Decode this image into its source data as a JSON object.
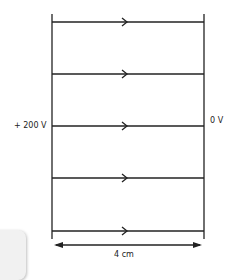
{
  "diagram": {
    "left_plate_label": "+ 200 V",
    "right_plate_label": "0 V",
    "separation_label": "4 cm",
    "field_lines": 5,
    "field_direction": "left-to-right",
    "colors": {
      "line": "#222222",
      "background": "#ffffff"
    }
  }
}
